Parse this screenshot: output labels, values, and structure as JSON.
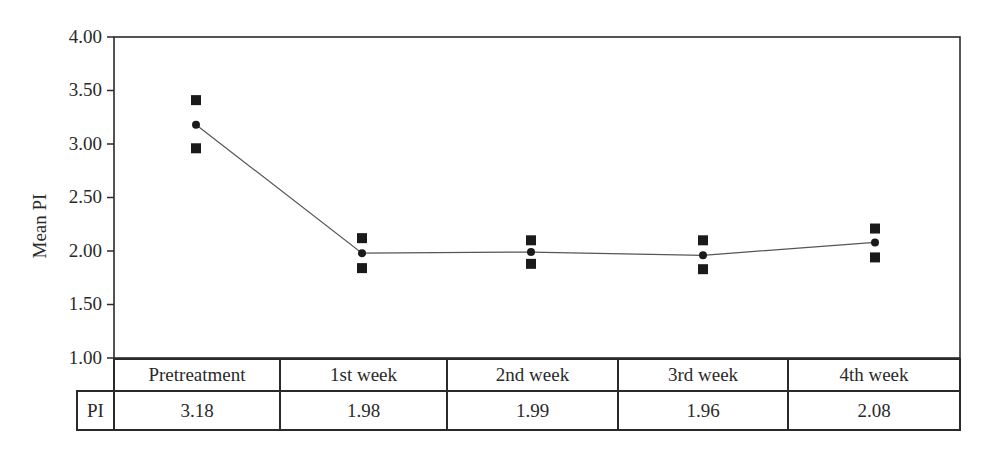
{
  "chart_data": {
    "type": "line",
    "title": "",
    "xlabel": "",
    "ylabel": "Mean PI",
    "ylim": [
      1.0,
      4.0
    ],
    "yticks": [
      "4.00",
      "3.50",
      "3.00",
      "2.50",
      "2.00",
      "1.50",
      "1.00"
    ],
    "grid": false,
    "legend": null,
    "categories": [
      "Pretreatment",
      "1st week",
      "2nd week",
      "3rd week",
      "4th week"
    ],
    "series": [
      {
        "name": "PI (mean)",
        "marker": "circle",
        "line": true,
        "values": [
          3.18,
          1.98,
          1.99,
          1.96,
          2.08
        ]
      },
      {
        "name": "upper bound",
        "marker": "square",
        "line": false,
        "values": [
          3.41,
          2.12,
          2.1,
          2.1,
          2.21
        ]
      },
      {
        "name": "lower bound",
        "marker": "square",
        "line": false,
        "values": [
          2.96,
          1.84,
          1.88,
          1.83,
          1.94
        ]
      }
    ],
    "table": {
      "row_label": "PI",
      "headers": [
        "Pretreatment",
        "1st week",
        "2nd week",
        "3rd week",
        "4th week"
      ],
      "values": [
        "3.18",
        "1.98",
        "1.99",
        "1.96",
        "2.08"
      ]
    }
  },
  "axis": {
    "ylabel": "Mean PI",
    "ticks": [
      "4.00",
      "3.50",
      "3.00",
      "2.50",
      "2.00",
      "1.50",
      "1.00"
    ]
  },
  "table": {
    "row_label": "PI",
    "headers": [
      "Pretreatment",
      "1st week",
      "2nd week",
      "3rd week",
      "4th week"
    ],
    "values": [
      "3.18",
      "1.98",
      "1.99",
      "1.96",
      "2.08"
    ]
  }
}
